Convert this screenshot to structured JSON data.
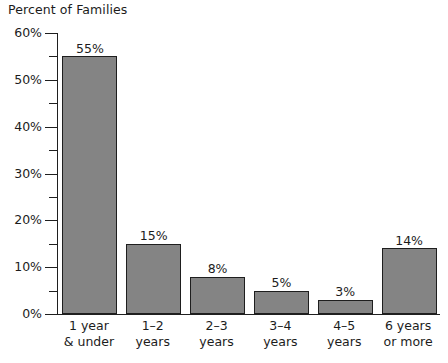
{
  "chart_data": {
    "type": "bar",
    "title": "Percent of Families",
    "xlabel": "",
    "ylabel": "",
    "ylim": [
      0,
      60
    ],
    "grid": false,
    "legend": "none",
    "y_major_step": 10,
    "y_minor_step": 5,
    "y_tick_labels": [
      "60%",
      "50%",
      "40%",
      "30%",
      "20%",
      "10%",
      "0%"
    ],
    "y_tick_values": [
      60,
      50,
      40,
      30,
      20,
      10,
      0
    ],
    "y_minor_values": [
      55,
      45,
      35,
      25,
      15,
      5
    ],
    "categories": [
      "1 year & under",
      "1–2 years",
      "2–3 years",
      "3–4 years",
      "4–5 years",
      "6 years or more"
    ],
    "category_lines": [
      [
        "1 year",
        "& under"
      ],
      [
        "1–2",
        "years"
      ],
      [
        "2–3",
        "years"
      ],
      [
        "3–4",
        "years"
      ],
      [
        "4–5",
        "years"
      ],
      [
        "6 years",
        "or more"
      ]
    ],
    "values": [
      55,
      15,
      8,
      5,
      3,
      14
    ],
    "data_labels": [
      "55%",
      "15%",
      "8%",
      "5%",
      "3%",
      "14%"
    ],
    "bar_color": "#848484",
    "bar_border_color": "#1e1e1e",
    "axis_color": "#1f1f1f",
    "background_color": "#ffffff",
    "text_color": "#1c1c1c"
  }
}
